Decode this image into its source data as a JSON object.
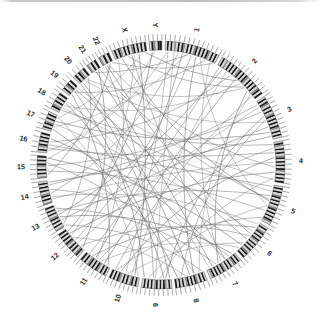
{
  "figure": {
    "type": "circos-genome-plot",
    "title": "",
    "background_color": "#fefefe",
    "link_color": "#6e6e6e",
    "band_dark_color": "#1c1c1c",
    "band_light_color": "#d6d6d6",
    "tick_color": "#555555",
    "label_color": "#2b2b2b"
  },
  "chart_data": {
    "type": "chord",
    "title": "",
    "xlabel": "",
    "ylabel": "",
    "legend": [],
    "grid": false,
    "ring": {
      "center_x": 161,
      "center_y": 165,
      "outer_radius": 131,
      "ideogram_outer_radius": 124,
      "ideogram_inner_radius": 115,
      "tick_outer_radius": 131,
      "label_radius": 140,
      "start_angle_deg": -88,
      "gap_deg": 1.6,
      "direction": "clockwise"
    },
    "categories": [
      "1",
      "2",
      "3",
      "4",
      "5",
      "6",
      "7",
      "8",
      "9",
      "10",
      "11",
      "12",
      "13",
      "14",
      "15",
      "16",
      "17",
      "18",
      "19",
      "20",
      "21",
      "22",
      "X",
      "Y"
    ],
    "values": [
      249,
      242,
      198,
      190,
      181,
      171,
      159,
      145,
      138,
      134,
      135,
      133,
      114,
      107,
      102,
      90,
      83,
      80,
      59,
      64,
      47,
      51,
      156,
      57
    ],
    "unit": "Mb",
    "chromosomes": [
      {
        "name": "1",
        "size_mb": 249,
        "label": "1",
        "bands": [
          0,
          1,
          0,
          1,
          0,
          2,
          0,
          1,
          0,
          1,
          2,
          0,
          1,
          0,
          1,
          0,
          2,
          1,
          0,
          1,
          0,
          1,
          0,
          1,
          2,
          0,
          1,
          0,
          1,
          0
        ]
      },
      {
        "name": "2",
        "size_mb": 242,
        "label": "2",
        "bands": [
          0,
          1,
          0,
          2,
          0,
          1,
          0,
          1,
          0,
          1,
          0,
          2,
          1,
          0,
          1,
          0,
          1,
          2,
          0,
          1,
          0,
          1,
          0,
          1,
          0,
          2,
          1,
          0,
          1
        ]
      },
      {
        "name": "3",
        "size_mb": 198,
        "label": "3",
        "bands": [
          0,
          1,
          0,
          1,
          2,
          0,
          1,
          0,
          1,
          0,
          2,
          1,
          0,
          1,
          0,
          1,
          0,
          1,
          2,
          0,
          1,
          0,
          1,
          0
        ]
      },
      {
        "name": "4",
        "size_mb": 190,
        "label": "4",
        "bands": [
          0,
          1,
          2,
          0,
          1,
          0,
          1,
          0,
          2,
          1,
          0,
          1,
          0,
          1,
          0,
          1,
          2,
          0,
          1,
          0,
          1,
          0,
          1
        ]
      },
      {
        "name": "5",
        "size_mb": 181,
        "label": "5",
        "bands": [
          0,
          1,
          0,
          1,
          0,
          2,
          1,
          0,
          1,
          0,
          1,
          0,
          2,
          1,
          0,
          1,
          0,
          1,
          0,
          1,
          2,
          0
        ]
      },
      {
        "name": "6",
        "size_mb": 171,
        "label": "6",
        "bands": [
          0,
          1,
          0,
          2,
          1,
          0,
          1,
          0,
          1,
          2,
          0,
          1,
          0,
          1,
          0,
          1,
          0,
          2,
          1,
          0,
          1
        ]
      },
      {
        "name": "7",
        "size_mb": 159,
        "label": "7",
        "bands": [
          0,
          1,
          0,
          1,
          2,
          0,
          1,
          0,
          1,
          0,
          2,
          1,
          0,
          1,
          0,
          1,
          0,
          1,
          2,
          0
        ]
      },
      {
        "name": "8",
        "size_mb": 145,
        "label": "8",
        "bands": [
          0,
          1,
          0,
          1,
          0,
          2,
          1,
          0,
          1,
          0,
          1,
          2,
          0,
          1,
          0,
          1,
          0,
          1
        ]
      },
      {
        "name": "9",
        "size_mb": 138,
        "label": "9",
        "bands": [
          0,
          1,
          0,
          2,
          1,
          0,
          1,
          0,
          1,
          2,
          0,
          1,
          0,
          1,
          0,
          1,
          0
        ]
      },
      {
        "name": "10",
        "size_mb": 134,
        "label": "10",
        "bands": [
          0,
          1,
          0,
          1,
          2,
          0,
          1,
          0,
          1,
          0,
          2,
          1,
          0,
          1,
          0,
          1
        ]
      },
      {
        "name": "11",
        "size_mb": 135,
        "label": "11",
        "bands": [
          0,
          1,
          0,
          1,
          0,
          2,
          1,
          0,
          1,
          0,
          1,
          2,
          0,
          1,
          0,
          1
        ]
      },
      {
        "name": "12",
        "size_mb": 133,
        "label": "12",
        "bands": [
          0,
          1,
          2,
          0,
          1,
          0,
          1,
          0,
          2,
          1,
          0,
          1,
          0,
          1,
          0,
          1
        ]
      },
      {
        "name": "13",
        "size_mb": 114,
        "label": "13",
        "bands": [
          2,
          0,
          1,
          0,
          1,
          0,
          1,
          2,
          0,
          1,
          0,
          1,
          0,
          1
        ]
      },
      {
        "name": "14",
        "size_mb": 107,
        "label": "14",
        "bands": [
          2,
          0,
          1,
          0,
          1,
          2,
          0,
          1,
          0,
          1,
          0,
          1,
          0
        ]
      },
      {
        "name": "15",
        "size_mb": 102,
        "label": "15",
        "bands": [
          2,
          0,
          1,
          0,
          1,
          0,
          2,
          1,
          0,
          1,
          0,
          1
        ]
      },
      {
        "name": "16",
        "size_mb": 90,
        "label": "16",
        "bands": [
          0,
          1,
          0,
          2,
          1,
          0,
          1,
          0,
          1,
          0,
          1
        ]
      },
      {
        "name": "17",
        "size_mb": 83,
        "label": "17",
        "bands": [
          0,
          1,
          0,
          1,
          2,
          0,
          1,
          0,
          1,
          0
        ]
      },
      {
        "name": "18",
        "size_mb": 80,
        "label": "18",
        "bands": [
          0,
          1,
          2,
          0,
          1,
          0,
          1,
          0,
          1
        ]
      },
      {
        "name": "19",
        "size_mb": 59,
        "label": "19",
        "bands": [
          0,
          1,
          0,
          2,
          1,
          0,
          1
        ]
      },
      {
        "name": "20",
        "size_mb": 64,
        "label": "20",
        "bands": [
          0,
          1,
          0,
          1,
          2,
          0,
          1
        ]
      },
      {
        "name": "21",
        "size_mb": 47,
        "label": "21",
        "bands": [
          2,
          0,
          1,
          0,
          1
        ]
      },
      {
        "name": "22",
        "size_mb": 51,
        "label": "22",
        "bands": [
          2,
          0,
          1,
          0,
          1
        ]
      },
      {
        "name": "X",
        "size_mb": 156,
        "label": "X",
        "bands": [
          0,
          1,
          0,
          1,
          2,
          0,
          1,
          0,
          1,
          0,
          2,
          1,
          0,
          1,
          0,
          1,
          0,
          1
        ]
      },
      {
        "name": "Y",
        "size_mb": 57,
        "label": "Y",
        "bands": [
          0,
          1,
          2,
          0,
          1,
          1
        ]
      }
    ],
    "links": [
      {
        "from": "1",
        "from_pos": 0.18,
        "to": "9",
        "to_pos": 0.55
      },
      {
        "from": "1",
        "from_pos": 0.26,
        "to": "14",
        "to_pos": 0.4
      },
      {
        "from": "1",
        "from_pos": 0.34,
        "to": "11",
        "to_pos": 0.62
      },
      {
        "from": "1",
        "from_pos": 0.42,
        "to": "17",
        "to_pos": 0.3
      },
      {
        "from": "1",
        "from_pos": 0.52,
        "to": "12",
        "to_pos": 0.48
      },
      {
        "from": "1",
        "from_pos": 0.61,
        "to": "8",
        "to_pos": 0.35
      },
      {
        "from": "1",
        "from_pos": 0.7,
        "to": "5",
        "to_pos": 0.58
      },
      {
        "from": "1",
        "from_pos": 0.8,
        "to": "19",
        "to_pos": 0.45
      },
      {
        "from": "2",
        "from_pos": 0.12,
        "to": "13",
        "to_pos": 0.55
      },
      {
        "from": "2",
        "from_pos": 0.22,
        "to": "10",
        "to_pos": 0.3
      },
      {
        "from": "2",
        "from_pos": 0.33,
        "to": "16",
        "to_pos": 0.6
      },
      {
        "from": "2",
        "from_pos": 0.45,
        "to": "11",
        "to_pos": 0.25
      },
      {
        "from": "2",
        "from_pos": 0.58,
        "to": "18",
        "to_pos": 0.5
      },
      {
        "from": "2",
        "from_pos": 0.68,
        "to": "X",
        "to_pos": 0.4
      },
      {
        "from": "2",
        "from_pos": 0.78,
        "to": "7",
        "to_pos": 0.6
      },
      {
        "from": "3",
        "from_pos": 0.15,
        "to": "12",
        "to_pos": 0.35
      },
      {
        "from": "3",
        "from_pos": 0.28,
        "to": "15",
        "to_pos": 0.55
      },
      {
        "from": "3",
        "from_pos": 0.4,
        "to": "9",
        "to_pos": 0.2
      },
      {
        "from": "3",
        "from_pos": 0.55,
        "to": "20",
        "to_pos": 0.45
      },
      {
        "from": "3",
        "from_pos": 0.68,
        "to": "13",
        "to_pos": 0.3
      },
      {
        "from": "3",
        "from_pos": 0.82,
        "to": "17",
        "to_pos": 0.65
      },
      {
        "from": "4",
        "from_pos": 0.14,
        "to": "11",
        "to_pos": 0.48
      },
      {
        "from": "4",
        "from_pos": 0.26,
        "to": "16",
        "to_pos": 0.25
      },
      {
        "from": "4",
        "from_pos": 0.38,
        "to": "10",
        "to_pos": 0.7
      },
      {
        "from": "4",
        "from_pos": 0.5,
        "to": "14",
        "to_pos": 0.15
      },
      {
        "from": "4",
        "from_pos": 0.63,
        "to": "22",
        "to_pos": 0.5
      },
      {
        "from": "4",
        "from_pos": 0.76,
        "to": "12",
        "to_pos": 0.8
      },
      {
        "from": "5",
        "from_pos": 0.18,
        "to": "18",
        "to_pos": 0.35
      },
      {
        "from": "5",
        "from_pos": 0.3,
        "to": "13",
        "to_pos": 0.7
      },
      {
        "from": "5",
        "from_pos": 0.44,
        "to": "X",
        "to_pos": 0.2
      },
      {
        "from": "5",
        "from_pos": 0.58,
        "to": "9",
        "to_pos": 0.8
      },
      {
        "from": "5",
        "from_pos": 0.72,
        "to": "15",
        "to_pos": 0.3
      },
      {
        "from": "6",
        "from_pos": 0.16,
        "to": "11",
        "to_pos": 0.75
      },
      {
        "from": "6",
        "from_pos": 0.3,
        "to": "17",
        "to_pos": 0.5
      },
      {
        "from": "6",
        "from_pos": 0.45,
        "to": "12",
        "to_pos": 0.2
      },
      {
        "from": "6",
        "from_pos": 0.58,
        "to": "19",
        "to_pos": 0.7
      },
      {
        "from": "6",
        "from_pos": 0.72,
        "to": "10",
        "to_pos": 0.45
      },
      {
        "from": "7",
        "from_pos": 0.2,
        "to": "14",
        "to_pos": 0.6
      },
      {
        "from": "7",
        "from_pos": 0.35,
        "to": "16",
        "to_pos": 0.8
      },
      {
        "from": "7",
        "from_pos": 0.5,
        "to": "1",
        "to_pos": 0.9
      },
      {
        "from": "7",
        "from_pos": 0.66,
        "to": "13",
        "to_pos": 0.85
      },
      {
        "from": "7",
        "from_pos": 0.8,
        "to": "21",
        "to_pos": 0.4
      },
      {
        "from": "8",
        "from_pos": 0.15,
        "to": "2",
        "to_pos": 0.88
      },
      {
        "from": "8",
        "from_pos": 0.3,
        "to": "15",
        "to_pos": 0.7
      },
      {
        "from": "8",
        "from_pos": 0.48,
        "to": "20",
        "to_pos": 0.25
      },
      {
        "from": "8",
        "from_pos": 0.62,
        "to": "12",
        "to_pos": 0.6
      },
      {
        "from": "8",
        "from_pos": 0.78,
        "to": "3",
        "to_pos": 0.5
      },
      {
        "from": "9",
        "from_pos": 0.25,
        "to": "18",
        "to_pos": 0.7
      },
      {
        "from": "9",
        "from_pos": 0.4,
        "to": "4",
        "to_pos": 0.9
      },
      {
        "from": "9",
        "from_pos": 0.62,
        "to": "22",
        "to_pos": 0.2
      },
      {
        "from": "10",
        "from_pos": 0.18,
        "to": "X",
        "to_pos": 0.75
      },
      {
        "from": "10",
        "from_pos": 0.52,
        "to": "1",
        "to_pos": 0.06
      },
      {
        "from": "10",
        "from_pos": 0.85,
        "to": "5",
        "to_pos": 0.92
      },
      {
        "from": "11",
        "from_pos": 0.1,
        "to": "19",
        "to_pos": 0.2
      },
      {
        "from": "11",
        "from_pos": 0.4,
        "to": "6",
        "to_pos": 0.9
      },
      {
        "from": "11",
        "from_pos": 0.88,
        "to": "2",
        "to_pos": 0.05
      },
      {
        "from": "12",
        "from_pos": 0.1,
        "to": "21",
        "to_pos": 0.7
      },
      {
        "from": "12",
        "from_pos": 0.7,
        "to": "X",
        "to_pos": 0.6
      },
      {
        "from": "13",
        "from_pos": 0.12,
        "to": "20",
        "to_pos": 0.8
      },
      {
        "from": "13",
        "from_pos": 0.45,
        "to": "7",
        "to_pos": 0.08
      },
      {
        "from": "14",
        "from_pos": 0.25,
        "to": "6",
        "to_pos": 0.05
      },
      {
        "from": "14",
        "from_pos": 0.8,
        "to": "3",
        "to_pos": 0.08
      },
      {
        "from": "15",
        "from_pos": 0.12,
        "to": "22",
        "to_pos": 0.75
      },
      {
        "from": "15",
        "from_pos": 0.88,
        "to": "Y",
        "to_pos": 0.4
      },
      {
        "from": "16",
        "from_pos": 0.45,
        "to": "5",
        "to_pos": 0.05
      },
      {
        "from": "17",
        "from_pos": 0.15,
        "to": "8",
        "to_pos": 0.9
      },
      {
        "from": "17",
        "from_pos": 0.85,
        "to": "X",
        "to_pos": 0.88
      },
      {
        "from": "18",
        "from_pos": 0.2,
        "to": "4",
        "to_pos": 0.05
      },
      {
        "from": "19",
        "from_pos": 0.55,
        "to": "9",
        "to_pos": 0.95
      },
      {
        "from": "20",
        "from_pos": 0.6,
        "to": "2",
        "to_pos": 0.7
      },
      {
        "from": "21",
        "from_pos": 0.25,
        "to": "1",
        "to_pos": 0.45
      },
      {
        "from": "22",
        "from_pos": 0.35,
        "to": "6",
        "to_pos": 0.4
      },
      {
        "from": "X",
        "from_pos": 0.08,
        "to": "11",
        "to_pos": 0.55
      },
      {
        "from": "X",
        "from_pos": 0.52,
        "to": "7",
        "to_pos": 0.35
      },
      {
        "from": "Y",
        "from_pos": 0.2,
        "to": "12",
        "to_pos": 0.9
      },
      {
        "from": "1",
        "from_pos": 0.05,
        "to": "16",
        "to_pos": 0.1
      },
      {
        "from": "2",
        "from_pos": 0.92,
        "to": "10",
        "to_pos": 0.92
      },
      {
        "from": "3",
        "from_pos": 0.92,
        "to": "14",
        "to_pos": 0.92
      },
      {
        "from": "4",
        "from_pos": 0.95,
        "to": "19",
        "to_pos": 0.9
      },
      {
        "from": "5",
        "from_pos": 0.4,
        "to": "21",
        "to_pos": 0.85
      },
      {
        "from": "6",
        "from_pos": 0.8,
        "to": "15",
        "to_pos": 0.92
      },
      {
        "from": "7",
        "from_pos": 0.9,
        "to": "18",
        "to_pos": 0.85
      },
      {
        "from": "8",
        "from_pos": 0.05,
        "to": "13",
        "to_pos": 0.05
      },
      {
        "from": "9",
        "from_pos": 0.05,
        "to": "20",
        "to_pos": 0.05
      },
      {
        "from": "10",
        "from_pos": 0.05,
        "to": "17",
        "to_pos": 0.92
      },
      {
        "from": "1",
        "from_pos": 0.95,
        "to": "22",
        "to_pos": 0.92
      },
      {
        "from": "2",
        "from_pos": 0.5,
        "to": "X",
        "to_pos": 0.95
      }
    ]
  }
}
